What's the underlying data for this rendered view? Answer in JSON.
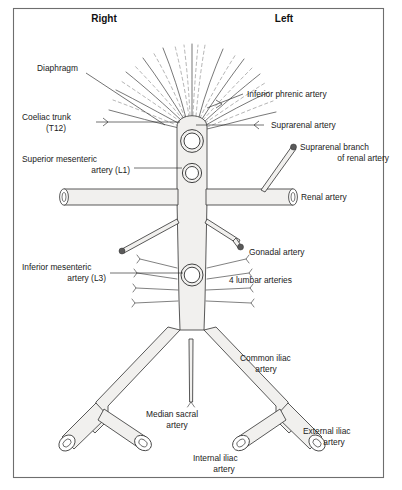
{
  "figure": {
    "side_headers": {
      "right": "Right",
      "left": "Left"
    },
    "labels": {
      "diaphragm": "Diaphragm",
      "coeliac_trunk_line1": "Coeliac trunk",
      "coeliac_trunk_line2": "(T12)",
      "superior_mesenteric_line1": "Superior mesenteric",
      "superior_mesenteric_line2": "artery (L1)",
      "inferior_mesenteric_line1": "Inferior mesenteric",
      "inferior_mesenteric_line2": "artery (L3)",
      "inferior_phrenic": "Inferior phrenic artery",
      "suprarenal": "Suprarenal artery",
      "suprarenal_branch_line1": "Suprarenal branch",
      "suprarenal_branch_line2": "of renal artery",
      "renal": "Renal artery",
      "gonadal": "Gonadal artery",
      "lumbar": "4 lumbar arteries",
      "common_iliac_line1": "Common iliac",
      "common_iliac_line2": "artery",
      "median_sacral_line1": "Median sacral",
      "median_sacral_line2": "artery",
      "internal_iliac_line1": "Internal iliac",
      "internal_iliac_line2": "artery",
      "external_iliac_line1": "External iliac",
      "external_iliac_line2": "artery"
    },
    "colors": {
      "vessel_fill": "#f1f0ee",
      "vessel_stroke": "#3b3b3b",
      "text": "#1b1b1b",
      "border": "#6e6e6e",
      "background": "#ffffff"
    },
    "counts": {
      "lumbar_arteries_per_side": 4
    }
  }
}
